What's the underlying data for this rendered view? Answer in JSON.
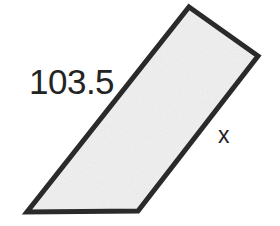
{
  "figure": {
    "name": "quadrilateral-side-length-diagram",
    "type": "geometry-figure",
    "background_color": "#ffffff",
    "shape": {
      "name": "slanted-quadrilateral",
      "kind": "quadrilateral",
      "fill_color": "#f0f0f0",
      "stroke_color": "#2a2a2a",
      "stroke_width": 5,
      "texture": "light-paper-noise",
      "vertices": [
        {
          "name": "top",
          "x": 189,
          "y": 7
        },
        {
          "name": "right",
          "x": 258,
          "y": 56
        },
        {
          "name": "bottom-right",
          "x": 138,
          "y": 211
        },
        {
          "name": "bottom-left",
          "x": 27,
          "y": 212
        }
      ],
      "edges": [
        {
          "name": "top-edge",
          "from": "top",
          "to": "right",
          "label": null
        },
        {
          "name": "right-edge",
          "from": "right",
          "to": "bottom-right",
          "label": "x"
        },
        {
          "name": "bottom-edge",
          "from": "bottom-right",
          "to": "bottom-left",
          "label": null
        },
        {
          "name": "left-edge",
          "from": "bottom-left",
          "to": "top",
          "label": "103.5"
        }
      ]
    },
    "labels": [
      {
        "name": "side-length-left",
        "text": "103.5",
        "x": 29,
        "y": 64,
        "font_size": 35,
        "color": "#242424"
      },
      {
        "name": "side-length-right",
        "text": "x",
        "x": 218,
        "y": 124,
        "font_size": 23,
        "color": "#242424"
      }
    ]
  }
}
